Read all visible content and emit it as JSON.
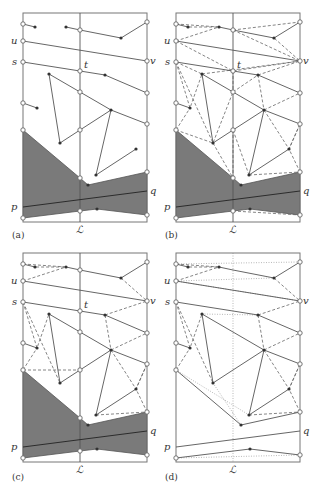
{
  "figure": {
    "panels": [
      {
        "id": "a",
        "caption": "(a)",
        "dx": 0,
        "dy": 0,
        "shaded": true,
        "triangulated": false,
        "vertical_style": "solid"
      },
      {
        "id": "b",
        "caption": "(b)",
        "dx": 153,
        "dy": 0,
        "shaded": true,
        "triangulated": true,
        "vertical_style": "solid"
      },
      {
        "id": "c",
        "caption": "(c)",
        "dx": 0,
        "dy": 240,
        "shaded": true,
        "triangulated": "partial",
        "vertical_style": "solid"
      },
      {
        "id": "d",
        "caption": "(d)",
        "dx": 153,
        "dy": 240,
        "shaded": false,
        "triangulated": "partial",
        "vertical_style": "dotted"
      }
    ],
    "labels": {
      "u": "u",
      "s": "s",
      "t": "t",
      "v": "v",
      "p": "p",
      "q": "q",
      "L": "ℒ"
    },
    "colors": {
      "shade": "#7a7a7a",
      "line": "#555555",
      "frame": "#777777"
    }
  }
}
